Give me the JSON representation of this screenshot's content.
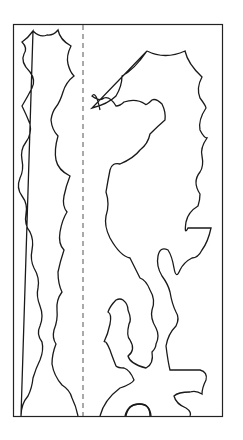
{
  "diagram": {
    "type": "cut-out template",
    "frame": {
      "x": 13,
      "y": 24,
      "width": 210,
      "height": 393,
      "stroke": "#222222"
    },
    "fold_line": {
      "x": 83,
      "style": "dashed",
      "stroke": "#555555"
    },
    "line_color": "#1a1a1a",
    "background": "#ffffff",
    "pieces": [
      {
        "name": "left-column-piece",
        "label": "Left piece"
      },
      {
        "name": "right-figure-piece",
        "label": "Right piece"
      }
    ]
  }
}
